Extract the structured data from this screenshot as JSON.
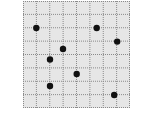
{
  "grid": {
    "rows": 8,
    "cols": 8,
    "cell_size": 13.4,
    "origin": {
      "x": 23,
      "y": 1
    },
    "background_color": "#e6e6e6",
    "line_color": "#8a8a8a",
    "dot_color": "#111111",
    "dot_radius": 3.2
  },
  "dots": [
    {
      "x": 36.3,
      "y": 28.0
    },
    {
      "x": 96.7,
      "y": 28.0
    },
    {
      "x": 117.2,
      "y": 41.6
    },
    {
      "x": 63.0,
      "y": 49.0
    },
    {
      "x": 50.0,
      "y": 59.5
    },
    {
      "x": 76.7,
      "y": 74.0
    },
    {
      "x": 50.0,
      "y": 86.0
    },
    {
      "x": 114.2,
      "y": 95.0
    }
  ]
}
